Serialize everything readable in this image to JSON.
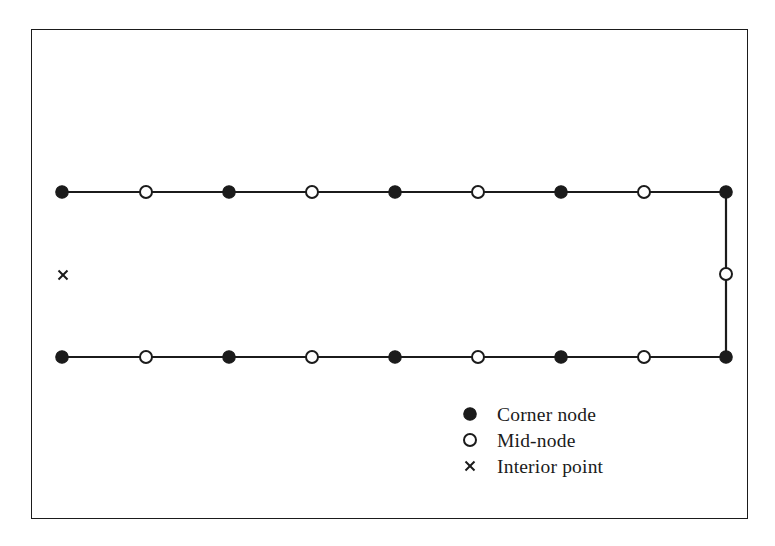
{
  "figure": {
    "name": "boundary-mesh-node-diagram",
    "background_color": "#ffffff",
    "line_color": "#1b1b1b",
    "fill_color": "#1b1b1b",
    "hollow_fill_color": "#ffffff",
    "frame": {
      "x": 31,
      "y": 29,
      "width": 717,
      "height": 490,
      "stroke_width": 1.6
    }
  },
  "chart_data": {
    "type": "scatter",
    "title": "",
    "xlabel": "",
    "ylabel": "",
    "grid": false,
    "legend_position": "bottom-right",
    "xlim": [
      31,
      748
    ],
    "ylim": [
      29,
      519
    ],
    "series": [
      {
        "name": "Corner node",
        "marker": "filled-circle",
        "marker_radius": 6.2,
        "color": "#1b1b1b",
        "points": [
          {
            "x": 62,
            "y": 192
          },
          {
            "x": 229,
            "y": 192
          },
          {
            "x": 395,
            "y": 192
          },
          {
            "x": 561,
            "y": 192
          },
          {
            "x": 726,
            "y": 192
          },
          {
            "x": 62,
            "y": 357
          },
          {
            "x": 229,
            "y": 357
          },
          {
            "x": 395,
            "y": 357
          },
          {
            "x": 561,
            "y": 357
          },
          {
            "x": 726,
            "y": 357
          }
        ]
      },
      {
        "name": "Mid-node",
        "marker": "hollow-circle",
        "marker_radius": 6.0,
        "color": "#1b1b1b",
        "points": [
          {
            "x": 146,
            "y": 192
          },
          {
            "x": 312,
            "y": 192
          },
          {
            "x": 478,
            "y": 192
          },
          {
            "x": 644,
            "y": 192
          },
          {
            "x": 146,
            "y": 357
          },
          {
            "x": 312,
            "y": 357
          },
          {
            "x": 478,
            "y": 357
          },
          {
            "x": 644,
            "y": 357
          },
          {
            "x": 726,
            "y": 274
          }
        ]
      },
      {
        "name": "Interior point",
        "marker": "cross",
        "marker_size": 9,
        "color": "#1b1b1b",
        "points": [
          {
            "x": 63,
            "y": 275
          }
        ]
      }
    ],
    "edges": [
      {
        "name": "top-edge",
        "x1": 62,
        "y1": 192,
        "x2": 726,
        "y2": 192
      },
      {
        "name": "bottom-edge",
        "x1": 62,
        "y1": 357,
        "x2": 726,
        "y2": 357
      },
      {
        "name": "right-edge",
        "x1": 726,
        "y1": 192,
        "x2": 726,
        "y2": 357
      }
    ]
  },
  "legend": {
    "x": 470,
    "y": 414,
    "row_height": 26,
    "label_x": 497,
    "items": [
      {
        "marker": "filled-circle",
        "label": "Corner node"
      },
      {
        "marker": "hollow-circle",
        "label": "Mid-node"
      },
      {
        "marker": "cross",
        "label": "Interior point"
      }
    ]
  }
}
